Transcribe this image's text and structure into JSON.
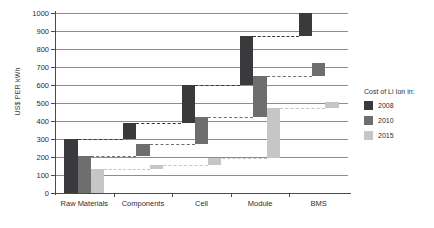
{
  "chart_data": {
    "type": "bar",
    "chart_style": "waterfall",
    "title": "",
    "xlabel": "",
    "ylabel": "US$ PER kWh",
    "categories": [
      "Raw Materials",
      "Components",
      "Cell",
      "Module",
      "BMS"
    ],
    "ylim": [
      0,
      1000
    ],
    "yticks": [
      0,
      100,
      200,
      300,
      400,
      500,
      600,
      700,
      800,
      900,
      1000
    ],
    "ytick_labels": [
      "0",
      "100",
      "200",
      "300",
      "400",
      "500",
      "600",
      "700",
      "800",
      "900",
      "1000"
    ],
    "grid": true,
    "legend_position": "right",
    "legend_title": "Cost of Li Ion in:",
    "series": [
      {
        "name": "2008",
        "color": "#3a3a3c",
        "cumulative": [
          300,
          390,
          600,
          870,
          1000
        ],
        "segments": [
          {
            "category": "Raw Materials",
            "base": 0,
            "top": 300,
            "value": 300
          },
          {
            "category": "Components",
            "base": 300,
            "top": 390,
            "value": 90
          },
          {
            "category": "Cell",
            "base": 390,
            "top": 600,
            "value": 210
          },
          {
            "category": "Module",
            "base": 600,
            "top": 870,
            "value": 270
          },
          {
            "category": "BMS",
            "base": 870,
            "top": 1000,
            "value": 130
          }
        ]
      },
      {
        "name": "2010",
        "color": "#6e6e70",
        "cumulative": [
          205,
          270,
          420,
          650,
          720
        ],
        "segments": [
          {
            "category": "Raw Materials",
            "base": 0,
            "top": 205,
            "value": 205
          },
          {
            "category": "Components",
            "base": 205,
            "top": 270,
            "value": 65
          },
          {
            "category": "Cell",
            "base": 270,
            "top": 420,
            "value": 150
          },
          {
            "category": "Module",
            "base": 420,
            "top": 650,
            "value": 230
          },
          {
            "category": "BMS",
            "base": 650,
            "top": 720,
            "value": 70
          }
        ]
      },
      {
        "name": "2015",
        "color": "#c6c6c6",
        "cumulative": [
          135,
          155,
          195,
          470,
          505
        ],
        "segments": [
          {
            "category": "Raw Materials",
            "base": 0,
            "top": 135,
            "value": 135
          },
          {
            "category": "Components",
            "base": 135,
            "top": 155,
            "value": 20
          },
          {
            "category": "Cell",
            "base": 155,
            "top": 195,
            "value": 40
          },
          {
            "category": "Module",
            "base": 195,
            "top": 470,
            "value": 275
          },
          {
            "category": "BMS",
            "base": 470,
            "top": 505,
            "value": 35
          }
        ]
      }
    ]
  },
  "legend": {
    "title": "Cost of Li Ion in:",
    "entries": [
      {
        "label": "2008",
        "color": "#3a3a3c"
      },
      {
        "label": "2010",
        "color": "#6e6e70"
      },
      {
        "label": "2015",
        "color": "#c6c6c6"
      }
    ]
  },
  "axes": {
    "y_title": "US$ PER kWh"
  }
}
